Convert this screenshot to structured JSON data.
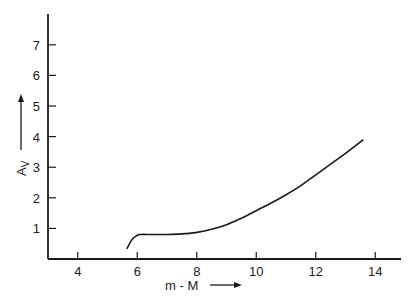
{
  "chart_data": {
    "type": "line",
    "title": "",
    "xlabel": "m - M",
    "ylabel": "A_V",
    "ylabel_main": "A",
    "ylabel_sub": "V",
    "xlim": [
      3,
      15
    ],
    "ylim": [
      0,
      8
    ],
    "x_ticks": [
      4,
      6,
      8,
      10,
      12,
      14
    ],
    "y_ticks": [
      1,
      2,
      3,
      4,
      5,
      6,
      7
    ],
    "grid": false,
    "legend": null,
    "series": [
      {
        "name": "A_V vs distance modulus",
        "x": [
          5.65,
          5.8,
          5.95,
          6.1,
          6.5,
          7.0,
          7.5,
          8.0,
          8.5,
          9.0,
          9.5,
          10.0,
          10.5,
          11.0,
          11.5,
          12.0,
          12.5,
          13.0,
          13.6
        ],
        "y": [
          0.33,
          0.6,
          0.75,
          0.8,
          0.8,
          0.8,
          0.82,
          0.87,
          0.97,
          1.12,
          1.33,
          1.58,
          1.83,
          2.1,
          2.4,
          2.75,
          3.1,
          3.45,
          3.9
        ]
      }
    ]
  },
  "axes": {
    "x_title": "m - M",
    "y_title_main": "A",
    "y_title_sub": "V"
  }
}
